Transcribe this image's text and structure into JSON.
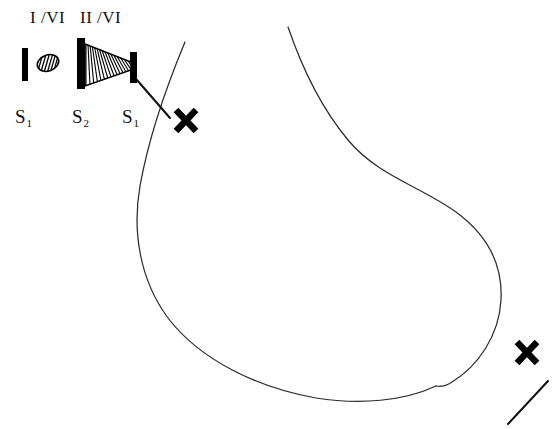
{
  "figure": {
    "width": 553,
    "height": 429,
    "background_color": "#ffffff",
    "ink_color": "#111111",
    "curve_color": "#2b2b2b",
    "type": "hand-drawn optical / beam schematic with enclosing contour"
  },
  "labels": {
    "roman": [
      {
        "text": "I /VI",
        "x": 30,
        "y": 8
      },
      {
        "text": "II /VI",
        "x": 80,
        "y": 8
      }
    ],
    "slits": [
      {
        "base": "S",
        "sub": "1",
        "x": 15,
        "y": 106
      },
      {
        "base": "S",
        "sub": "2",
        "x": 72,
        "y": 106
      },
      {
        "base": "S",
        "sub": "1",
        "x": 122,
        "y": 106
      }
    ]
  },
  "elements": {
    "bars": [
      {
        "name": "slit-bar-s1-left",
        "x": 22,
        "y": 48,
        "w": 6,
        "h": 33
      },
      {
        "name": "slit-bar-s2",
        "x": 77,
        "y": 38,
        "w": 8,
        "h": 51
      },
      {
        "name": "slit-bar-s1-right",
        "x": 130,
        "y": 52,
        "w": 7,
        "h": 31
      }
    ],
    "hatched_diamond": {
      "name": "hatched-lens-diamond",
      "cx": 48,
      "cy": 63,
      "rx": 11,
      "ry": 8,
      "rotation": -20,
      "stripes": 9
    },
    "hatched_cone": {
      "name": "hatched-beam-cone",
      "left_x": 85,
      "left_top_y": 44,
      "left_bottom_y": 86,
      "right_x": 131,
      "right_top_y": 62,
      "right_bottom_y": 70,
      "stripes": 24
    }
  },
  "markers": {
    "x_marks": [
      {
        "name": "x-mark-upper-left",
        "cx": 186,
        "cy": 120,
        "size": 13
      },
      {
        "name": "x-mark-lower-right",
        "cx": 527,
        "cy": 352,
        "size": 13
      }
    ],
    "pointer_lines": [
      {
        "name": "pointer-line-upper",
        "x1": 137,
        "y1": 80,
        "x2": 170,
        "y2": 118
      },
      {
        "name": "pointer-line-lower",
        "x1": 548,
        "y1": 381,
        "x2": 508,
        "y2": 424
      }
    ]
  },
  "contour": {
    "name": "main-hand-drawn-contour",
    "left_branch_start": {
      "x": 185,
      "y": 42
    },
    "right_branch_start": {
      "x": 288,
      "y": 27
    },
    "rightmost": {
      "x": 503,
      "y": 232
    },
    "bottom": {
      "y": 399
    },
    "description": "open kidney / bean shaped hand drawn outline, two branches starting near top, meeting at the bottom"
  }
}
